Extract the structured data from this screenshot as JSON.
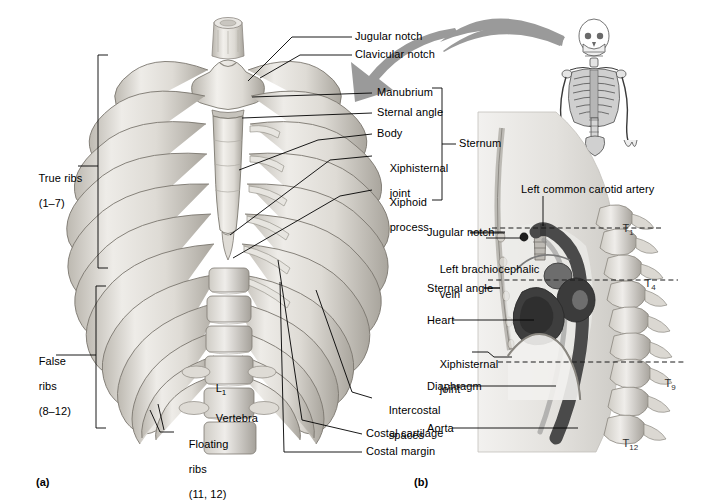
{
  "figure": {
    "background_color": "#ffffff",
    "panels": [
      {
        "id": "panel-a",
        "caption": "(a)",
        "description": "Anterior view of the bony thoracic cage"
      },
      {
        "id": "panel-b",
        "caption": "(b)",
        "description": "Midsagittal section of the thorax showing heart, great vessels and diaphragm"
      }
    ]
  },
  "panel_a": {
    "caption": "(a)",
    "brackets": [
      {
        "name": "true-ribs",
        "label_line1": "True ribs",
        "label_line2": "(1–7)"
      },
      {
        "name": "false-ribs",
        "label_line1": "False",
        "label_line2": "ribs",
        "label_line3": "(8–12)"
      }
    ],
    "labels_top_right": [
      {
        "name": "jugular-notch",
        "text": "Jugular notch"
      },
      {
        "name": "clavicular-notch",
        "text": "Clavicular notch"
      },
      {
        "name": "manubrium",
        "text": "Manubrium"
      },
      {
        "name": "sternal-angle",
        "text": "Sternal angle"
      },
      {
        "name": "body",
        "text": "Body"
      },
      {
        "name": "xiphisternal-joint",
        "text": "Xiphisternal",
        "text2": "joint"
      },
      {
        "name": "xiphoid-process",
        "text": "Xiphoid",
        "text2": "process"
      }
    ],
    "sternum_bracket_label": "Sternum",
    "labels_bottom": [
      {
        "name": "floating-ribs",
        "text": "Floating",
        "text2": "ribs",
        "text3": "(11, 12)"
      },
      {
        "name": "costal-cartilage",
        "text": "Costal cartilage"
      },
      {
        "name": "costal-margin",
        "text": "Costal margin"
      },
      {
        "name": "intercostal-spaces",
        "text": "Intercostal",
        "text2": "spaces"
      }
    ],
    "vertebra_label": {
      "name": "l1-vertebra",
      "text": "L",
      "subscript": "1",
      "text2": "Vertebra"
    }
  },
  "panel_b": {
    "caption": "(b)",
    "top_label": {
      "name": "left-common-carotid-artery",
      "text": "Left common carotid artery"
    },
    "left_labels": [
      {
        "name": "jugular-notch",
        "text": "Jugular notch"
      },
      {
        "name": "left-brachiocephalic-vein",
        "text": "Left brachiocephalic",
        "text2": "vein"
      },
      {
        "name": "sternal-angle",
        "text": "Sternal angle"
      },
      {
        "name": "heart",
        "text": "Heart"
      },
      {
        "name": "xiphisternal-joint",
        "text": "Xiphisternal",
        "text2": "joint"
      },
      {
        "name": "diaphragm",
        "text": "Diaphragm"
      },
      {
        "name": "aorta",
        "text": "Aorta"
      }
    ],
    "vertebrae": [
      {
        "name": "vertebra-t1",
        "letter": "T",
        "number": "1"
      },
      {
        "name": "vertebra-t4",
        "letter": "T",
        "number": "4"
      },
      {
        "name": "vertebra-t9",
        "letter": "T",
        "number": "9"
      },
      {
        "name": "vertebra-t12",
        "letter": "T",
        "number": "12"
      }
    ]
  },
  "orientation": {
    "arrow_name": "orientation-arrow",
    "skeleton_name": "whole-skeleton-thumbnail"
  },
  "colors": {
    "bone_light": "#e8e6e1",
    "bone_mid": "#cdcac3",
    "bone_shadow": "#a8a49c",
    "bone_outline": "#6e6a63",
    "arrow_gray": "#9a9a9a",
    "body_fill": "#e3e1dd",
    "heart_dark": "#4e4e4e",
    "vessel_dark": "#555555",
    "vessel_mid": "#7d7d7d",
    "line_black": "#000000"
  }
}
